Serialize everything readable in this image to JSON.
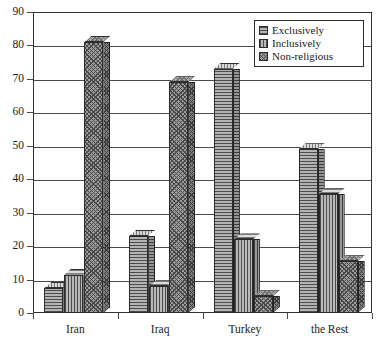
{
  "chart_data": {
    "type": "bar",
    "title": "",
    "subtitle": "",
    "xlabel": "",
    "ylabel": "",
    "ylim": [
      0,
      90
    ],
    "yticks": [
      0,
      10,
      20,
      30,
      40,
      50,
      60,
      70,
      80,
      90
    ],
    "grid": true,
    "legend_position": "top-right",
    "categories": [
      "Iran",
      "Iraq",
      "Turkey",
      "the Rest"
    ],
    "series": [
      {
        "name": "Exclusively",
        "values": [
          7.5,
          23,
          73,
          49
        ]
      },
      {
        "name": "Inclusively",
        "values": [
          11.5,
          8,
          22,
          35.5
        ]
      },
      {
        "name": "Non-religious",
        "values": [
          81,
          69,
          5,
          15.5
        ]
      }
    ],
    "annotations": []
  },
  "axis": {
    "y_ticks": [
      "90",
      "80",
      "70",
      "60",
      "50",
      "40",
      "30",
      "20",
      "10",
      "0"
    ],
    "x_labels": [
      "Iran",
      "Iraq",
      "Turkey",
      "the Rest"
    ]
  },
  "legend": {
    "entries": [
      {
        "label": "Exclusively",
        "pattern": "horizontal-hatch"
      },
      {
        "label": "Inclusively",
        "pattern": "vertical-hatch"
      },
      {
        "label": "Non-religious",
        "pattern": "cross-hatch"
      }
    ]
  },
  "colors": {
    "axis": "#4a4a4a",
    "frame": "#333333",
    "bar_outline": "#2b2b2b",
    "bar_fill": "#969696",
    "background": "#ffffff"
  }
}
